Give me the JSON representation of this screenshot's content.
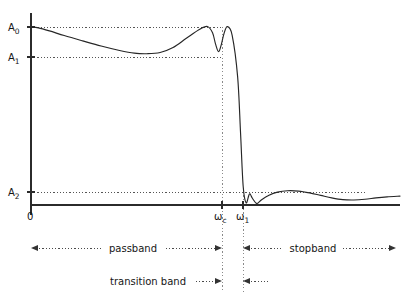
{
  "figure": {
    "axes": {
      "origin_label": "0",
      "x_axis_name": "frequency-axis",
      "y_axis_name": "magnitude-axis"
    },
    "y_levels": [
      {
        "id": "A0",
        "label": "A",
        "subscript": "0",
        "value": 1.0,
        "y_px": 27
      },
      {
        "id": "A1",
        "label": "A",
        "subscript": "1",
        "value": 0.85,
        "y_px": 57
      },
      {
        "id": "A2",
        "label": "A",
        "subscript": "2",
        "value": 0.06,
        "y_px": 192
      }
    ],
    "x_markers": [
      {
        "id": "wc",
        "label": "ω",
        "subscript": "c",
        "x_px": 222
      },
      {
        "id": "w1",
        "label": "ω",
        "subscript": "1",
        "x_px": 243
      }
    ],
    "bands": [
      {
        "id": "passband",
        "label": "passband",
        "from_px": 31,
        "to_px": 222,
        "row_y_px": 248
      },
      {
        "id": "stopband",
        "label": "stopband",
        "from_px": 243,
        "to_px": 396,
        "row_y_px": 248
      },
      {
        "id": "transition",
        "label": "transition band",
        "from_px": 31,
        "to_px": 222,
        "row_y_px": 281
      },
      {
        "id": "transition-right",
        "label": "",
        "from_px": 243,
        "to_px": 268,
        "row_y_px": 281
      }
    ]
  },
  "chart_data": {
    "type": "line",
    "title": "",
    "xlabel": "",
    "ylabel": "",
    "xlim": [
      0,
      1
    ],
    "ylim": [
      0,
      1.06
    ],
    "grid": false,
    "legend": null,
    "annotations": [
      "A0 — upper passband ripple bound",
      "A1 — lower passband ripple bound",
      "A2 — stopband attenuation bound",
      "ωc — passband edge / cutoff frequency",
      "ω1 — stopband edge frequency",
      "passband",
      "stopband",
      "transition band"
    ],
    "reference_levels": {
      "A0": 1.0,
      "A1": 0.85,
      "A2": 0.06
    },
    "reference_frequencies": {
      "wc": 0.5,
      "w1": 0.575
    },
    "series": [
      {
        "name": "magnitude response",
        "x": [
          0.0,
          0.02,
          0.05,
          0.09,
          0.14,
          0.19,
          0.24,
          0.28,
          0.315,
          0.35,
          0.385,
          0.42,
          0.455,
          0.478,
          0.492,
          0.5,
          0.508,
          0.515,
          0.523,
          0.532,
          0.545,
          0.56,
          0.568,
          0.575,
          0.583,
          0.592,
          0.6,
          0.612,
          0.625,
          0.645,
          0.668,
          0.695,
          0.725,
          0.755,
          0.785,
          0.815,
          0.845,
          0.875,
          0.905,
          0.935,
          0.965,
          1.0
        ],
        "y": [
          1.0,
          0.995,
          0.978,
          0.952,
          0.922,
          0.893,
          0.868,
          0.853,
          0.85,
          0.857,
          0.885,
          0.935,
          0.985,
          1.003,
          0.968,
          0.905,
          0.862,
          0.895,
          0.963,
          1.002,
          0.955,
          0.72,
          0.4,
          0.105,
          0.012,
          0.062,
          0.038,
          0.008,
          0.03,
          0.055,
          0.072,
          0.08,
          0.078,
          0.068,
          0.054,
          0.04,
          0.03,
          0.028,
          0.032,
          0.04,
          0.046,
          0.05
        ]
      }
    ]
  }
}
